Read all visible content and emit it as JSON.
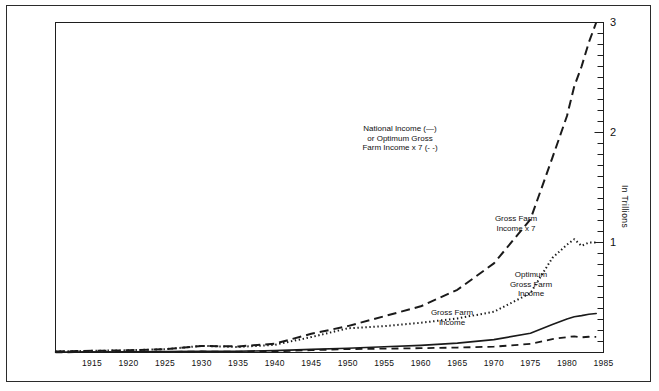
{
  "chart_data": {
    "type": "line",
    "title": "",
    "subtitle": "",
    "xlabel": "",
    "ylabel": "In Trillions",
    "xlim": [
      1910,
      1985
    ],
    "ylim": [
      0,
      3
    ],
    "grid": false,
    "legend_position": "inline-annotations",
    "x_ticks": [
      "1915",
      "1920",
      "1925",
      "1930",
      "1935",
      "1940",
      "1945",
      "1950",
      "1955",
      "1960",
      "1965",
      "1970",
      "1975",
      "1980",
      "1985"
    ],
    "y_ticks": [
      "1",
      "2",
      "3"
    ],
    "y_minor_tick_step": 0.1,
    "annotations": [
      {
        "name": "national-income-label",
        "text": "National Income (—)\nor Optimum Gross\nFarm Income x 7 (- -)",
        "x_px": 400,
        "y_px": 124
      },
      {
        "name": "gross-farm-income-x7-label",
        "text": "Gross Farm\nIncome x 7",
        "x_px": 516,
        "y_px": 214
      },
      {
        "name": "optimum-gross-farm-income-label",
        "text": "Optimum\nGross Farm\nIncome",
        "x_px": 531,
        "y_px": 270
      },
      {
        "name": "gross-farm-income-label",
        "text": "Gross Farm\nIncome",
        "x_px": 452,
        "y_px": 308
      }
    ],
    "x": [
      1910,
      1915,
      1920,
      1925,
      1930,
      1935,
      1940,
      1945,
      1950,
      1955,
      1960,
      1965,
      1970,
      1975,
      1978,
      1980,
      1981,
      1982,
      1983,
      1984
    ],
    "series": [
      {
        "name": "National Income",
        "style": "dashed",
        "values": [
          0.01,
          0.015,
          0.02,
          0.03,
          0.06,
          0.055,
          0.08,
          0.17,
          0.24,
          0.33,
          0.42,
          0.57,
          0.81,
          1.21,
          1.77,
          2.15,
          2.42,
          2.6,
          2.82,
          3.0
        ]
      },
      {
        "name": "Gross Farm Income x 7",
        "style": "dotted",
        "values": [
          0.01,
          0.015,
          0.02,
          0.03,
          0.06,
          0.05,
          0.07,
          0.14,
          0.22,
          0.24,
          0.27,
          0.31,
          0.37,
          0.54,
          0.86,
          0.98,
          1.03,
          0.97,
          1.0,
          1.0
        ]
      },
      {
        "name": "Optimum Gross Farm Income",
        "style": "solid",
        "values": [
          0.004,
          0.005,
          0.007,
          0.009,
          0.012,
          0.012,
          0.017,
          0.028,
          0.038,
          0.052,
          0.065,
          0.085,
          0.117,
          0.175,
          0.255,
          0.305,
          0.325,
          0.335,
          0.348,
          0.355
        ]
      },
      {
        "name": "Gross Farm Income",
        "style": "dashed-thin",
        "values": [
          0.002,
          0.003,
          0.004,
          0.005,
          0.009,
          0.007,
          0.011,
          0.021,
          0.031,
          0.035,
          0.039,
          0.045,
          0.053,
          0.078,
          0.122,
          0.14,
          0.147,
          0.138,
          0.143,
          0.142
        ]
      }
    ]
  }
}
